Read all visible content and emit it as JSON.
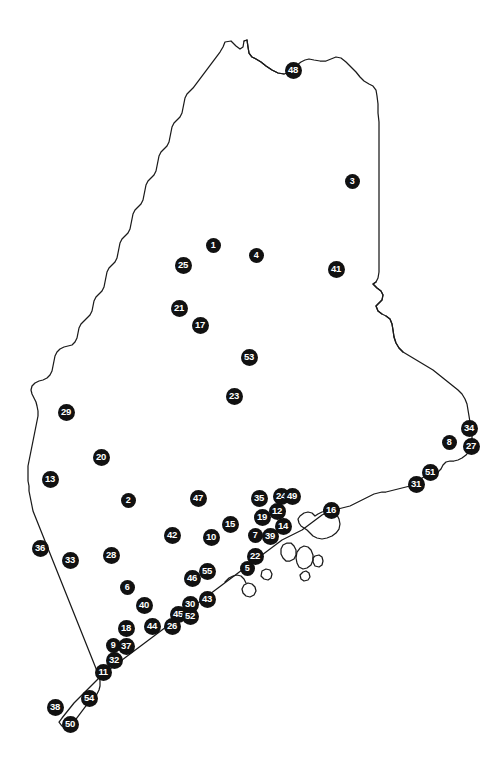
{
  "map": {
    "region_name": "Maine",
    "outline_color": "#1a1a1a",
    "background_color": "#ffffff",
    "marker_fill_color": "#111111",
    "marker_text_color": "#ffffff",
    "marker_count": 55,
    "markers": [
      {
        "id": "1",
        "label": "1",
        "x": 213,
        "y": 245
      },
      {
        "id": "2",
        "label": "2",
        "x": 128,
        "y": 500
      },
      {
        "id": "3",
        "label": "3",
        "x": 352,
        "y": 181
      },
      {
        "id": "4",
        "label": "4",
        "x": 256,
        "y": 255
      },
      {
        "id": "5",
        "label": "5",
        "x": 247,
        "y": 568
      },
      {
        "id": "6",
        "label": "6",
        "x": 127,
        "y": 587
      },
      {
        "id": "7",
        "label": "7",
        "x": 255,
        "y": 535
      },
      {
        "id": "8",
        "label": "8",
        "x": 449,
        "y": 442
      },
      {
        "id": "9",
        "label": "9",
        "x": 113,
        "y": 645
      },
      {
        "id": "10",
        "label": "10",
        "x": 211,
        "y": 537
      },
      {
        "id": "11",
        "label": "11",
        "x": 103,
        "y": 672
      },
      {
        "id": "12",
        "label": "12",
        "x": 277,
        "y": 511
      },
      {
        "id": "13",
        "label": "13",
        "x": 50,
        "y": 479
      },
      {
        "id": "14",
        "label": "14",
        "x": 283,
        "y": 526
      },
      {
        "id": "15",
        "label": "15",
        "x": 230,
        "y": 524
      },
      {
        "id": "16",
        "label": "16",
        "x": 331,
        "y": 510
      },
      {
        "id": "17",
        "label": "17",
        "x": 200,
        "y": 325
      },
      {
        "id": "18",
        "label": "18",
        "x": 126,
        "y": 628
      },
      {
        "id": "19",
        "label": "19",
        "x": 262,
        "y": 517
      },
      {
        "id": "20",
        "label": "20",
        "x": 101,
        "y": 457
      },
      {
        "id": "21",
        "label": "21",
        "x": 179,
        "y": 308
      },
      {
        "id": "22",
        "label": "22",
        "x": 255,
        "y": 556
      },
      {
        "id": "23",
        "label": "23",
        "x": 234,
        "y": 396
      },
      {
        "id": "24",
        "label": "24",
        "x": 281,
        "y": 496
      },
      {
        "id": "25",
        "label": "25",
        "x": 183,
        "y": 265
      },
      {
        "id": "26",
        "label": "26",
        "x": 172,
        "y": 626
      },
      {
        "id": "27",
        "label": "27",
        "x": 471,
        "y": 446
      },
      {
        "id": "28",
        "label": "28",
        "x": 111,
        "y": 555
      },
      {
        "id": "29",
        "label": "29",
        "x": 66,
        "y": 412
      },
      {
        "id": "30",
        "label": "30",
        "x": 190,
        "y": 604
      },
      {
        "id": "31",
        "label": "31",
        "x": 416,
        "y": 484
      },
      {
        "id": "32",
        "label": "32",
        "x": 114,
        "y": 660
      },
      {
        "id": "33",
        "label": "33",
        "x": 70,
        "y": 560
      },
      {
        "id": "34",
        "label": "34",
        "x": 469,
        "y": 428
      },
      {
        "id": "35",
        "label": "35",
        "x": 259,
        "y": 498
      },
      {
        "id": "36",
        "label": "36",
        "x": 40,
        "y": 548
      },
      {
        "id": "37",
        "label": "37",
        "x": 126,
        "y": 646
      },
      {
        "id": "38",
        "label": "38",
        "x": 55,
        "y": 707
      },
      {
        "id": "39",
        "label": "39",
        "x": 270,
        "y": 536
      },
      {
        "id": "40",
        "label": "40",
        "x": 144,
        "y": 605
      },
      {
        "id": "41",
        "label": "41",
        "x": 336,
        "y": 269
      },
      {
        "id": "42",
        "label": "42",
        "x": 172,
        "y": 535
      },
      {
        "id": "43",
        "label": "43",
        "x": 207,
        "y": 599
      },
      {
        "id": "44",
        "label": "44",
        "x": 152,
        "y": 626
      },
      {
        "id": "45",
        "label": "45",
        "x": 178,
        "y": 614
      },
      {
        "id": "46",
        "label": "46",
        "x": 192,
        "y": 578
      },
      {
        "id": "47",
        "label": "47",
        "x": 198,
        "y": 498
      },
      {
        "id": "48",
        "label": "48",
        "x": 293,
        "y": 70
      },
      {
        "id": "49",
        "label": "49",
        "x": 292,
        "y": 496
      },
      {
        "id": "50",
        "label": "50",
        "x": 70,
        "y": 724
      },
      {
        "id": "51",
        "label": "51",
        "x": 430,
        "y": 472
      },
      {
        "id": "52",
        "label": "52",
        "x": 190,
        "y": 616
      },
      {
        "id": "53",
        "label": "53",
        "x": 249,
        "y": 357
      },
      {
        "id": "54",
        "label": "54",
        "x": 89,
        "y": 698
      },
      {
        "id": "55",
        "label": "55",
        "x": 207,
        "y": 571
      }
    ]
  }
}
